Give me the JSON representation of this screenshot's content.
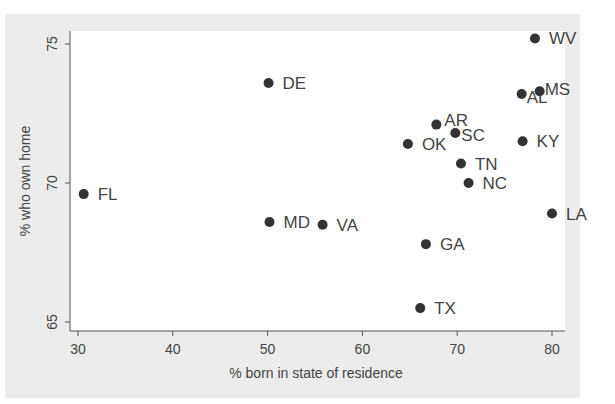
{
  "chart_data": {
    "type": "scatter",
    "title": "",
    "xlabel": "% born in state of residence",
    "ylabel": "% who own home",
    "xlim": [
      29.2,
      81
    ],
    "ylim": [
      64.7,
      76.2
    ],
    "xticks": [
      30,
      40,
      50,
      60,
      70,
      80
    ],
    "yticks": [
      65,
      70,
      75
    ],
    "grid": false,
    "legend": null,
    "marker_color": "#333333",
    "points": [
      {
        "label": "FL",
        "x": 30.6,
        "y": 69.6
      },
      {
        "label": "DE",
        "x": 50.1,
        "y": 73.6
      },
      {
        "label": "MD",
        "x": 50.2,
        "y": 68.6
      },
      {
        "label": "VA",
        "x": 55.8,
        "y": 68.5
      },
      {
        "label": "OK",
        "x": 64.8,
        "y": 71.4
      },
      {
        "label": "AR",
        "x": 67.8,
        "y": 72.1
      },
      {
        "label": "SC",
        "x": 69.8,
        "y": 71.8
      },
      {
        "label": "TN",
        "x": 70.4,
        "y": 70.7
      },
      {
        "label": "NC",
        "x": 71.2,
        "y": 70.0
      },
      {
        "label": "GA",
        "x": 66.7,
        "y": 67.8
      },
      {
        "label": "TX",
        "x": 66.1,
        "y": 65.5
      },
      {
        "label": "KY",
        "x": 76.9,
        "y": 71.5
      },
      {
        "label": "AL",
        "x": 76.8,
        "y": 73.2
      },
      {
        "label": "MS",
        "x": 78.7,
        "y": 73.3
      },
      {
        "label": "WV",
        "x": 78.2,
        "y": 75.2
      },
      {
        "label": "LA",
        "x": 80.0,
        "y": 68.9
      }
    ]
  }
}
